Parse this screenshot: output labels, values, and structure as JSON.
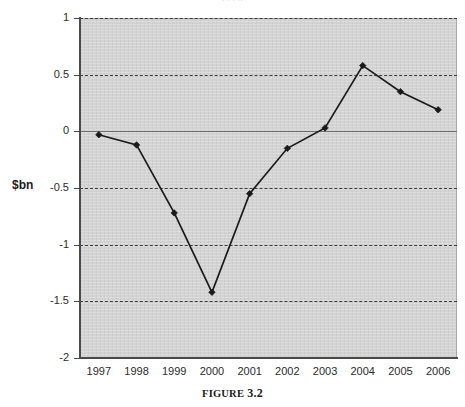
{
  "page": {
    "clipped_top_text": ". .   . ..",
    "caption_prefix": "Figure",
    "caption_number": "3.2",
    "caption_full": "FIGURE 3.2"
  },
  "chart_data": {
    "type": "line",
    "title": "",
    "xlabel": "",
    "ylabel": "$bn",
    "ylim": [
      -2,
      1
    ],
    "ytick_values": [
      1,
      0.5,
      0,
      -0.5,
      -1,
      -1.5,
      -2
    ],
    "ytick_labels": [
      "1",
      "0.5",
      "0",
      "-0.5",
      "-1",
      "-1.5",
      "-2"
    ],
    "grid": true,
    "grid_style": "dashed-horizontal",
    "legend": null,
    "legend_position": "none",
    "plot_background": "#d3d3d3",
    "series_color": "#1a1a1a",
    "marker": "diamond",
    "categories": [
      "1997",
      "1998",
      "1999",
      "2000",
      "2001",
      "2002",
      "2003",
      "2004",
      "2005",
      "2006"
    ],
    "values": [
      -0.03,
      -0.12,
      -0.72,
      -1.42,
      -0.55,
      -0.15,
      0.03,
      0.58,
      0.35,
      0.19
    ],
    "series": [
      {
        "name": "$bn",
        "values": [
          -0.03,
          -0.12,
          -0.72,
          -1.42,
          -0.55,
          -0.15,
          0.03,
          0.58,
          0.35,
          0.19
        ]
      }
    ]
  }
}
